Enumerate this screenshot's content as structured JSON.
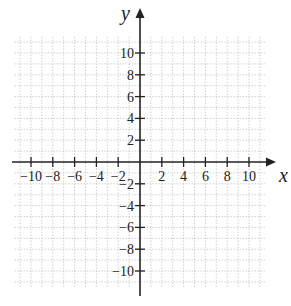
{
  "chart_data": {
    "type": "scatter",
    "title": "",
    "xlabel": "x",
    "ylabel": "y",
    "xlim": [
      -12,
      12
    ],
    "ylim": [
      -12,
      12
    ],
    "grid": true,
    "grid_style": "dotted",
    "x_ticks": [
      -10,
      -8,
      -6,
      -4,
      -2,
      2,
      4,
      6,
      8,
      10
    ],
    "y_ticks": [
      10,
      8,
      6,
      4,
      2,
      -2,
      -4,
      -6,
      -8,
      -10
    ],
    "x_tick_labels": [
      "−10",
      "−8",
      "−6",
      "−4",
      "−2",
      "2",
      "4",
      "6",
      "8",
      "10"
    ],
    "y_tick_labels": [
      "10",
      "8",
      "6",
      "4",
      "2",
      "−2",
      "−4",
      "−6",
      "−8",
      "−10"
    ],
    "series": []
  },
  "colors": {
    "axis": "#222222",
    "grid": "#b8b8b8"
  }
}
